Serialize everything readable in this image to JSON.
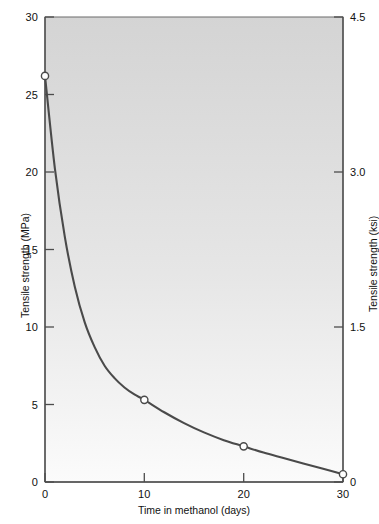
{
  "chart_data": {
    "type": "line",
    "title": "",
    "subtitle": "",
    "xlabel": "Time in methanol (days)",
    "ylabel": "Tensile strength (MPa)",
    "y2label": "Tensile strength (ksi)",
    "xlim": [
      0,
      30
    ],
    "ylim": [
      0,
      30
    ],
    "y2lim": [
      0,
      4.5
    ],
    "grid": false,
    "legend": null,
    "x_ticks": [
      0,
      10,
      20,
      30
    ],
    "x_tick_labels": [
      "0",
      "10",
      "20",
      "30"
    ],
    "y_ticks": [
      0,
      5,
      10,
      15,
      20,
      25,
      30
    ],
    "y_tick_labels": [
      "0",
      "5",
      "10",
      "15",
      "20",
      "25",
      "30"
    ],
    "y2_ticks": [
      0,
      1.5,
      3.0,
      4.5
    ],
    "y2_tick_labels": [
      "0",
      "1.5",
      "3.0",
      "4.5"
    ],
    "series": [
      {
        "name": "Tensile strength",
        "marker": "open-circle",
        "line_color": "#4a4a4a",
        "x": [
          0,
          10,
          20,
          30
        ],
        "values": [
          26.2,
          5.3,
          2.3,
          0.5
        ]
      }
    ],
    "curve": {
      "description": "smooth exponential decay through the four measured points",
      "x": [
        0,
        1,
        2,
        3,
        4,
        5,
        6,
        7,
        8,
        9,
        10,
        12,
        14,
        16,
        18,
        20,
        22,
        24,
        26,
        28,
        30
      ],
      "y": [
        26.2,
        20.2,
        15.8,
        12.6,
        10.3,
        8.7,
        7.5,
        6.7,
        6.1,
        5.65,
        5.3,
        4.5,
        3.8,
        3.2,
        2.7,
        2.3,
        1.9,
        1.55,
        1.2,
        0.85,
        0.5
      ]
    },
    "colors": {
      "plot_background_top": "#d4d4d4",
      "plot_background_bottom": "#fbfbfb",
      "curve": "#4a4a4a",
      "axis": "#4c4c4c",
      "marker_fill": "#ffffff",
      "text": "#111111"
    }
  }
}
